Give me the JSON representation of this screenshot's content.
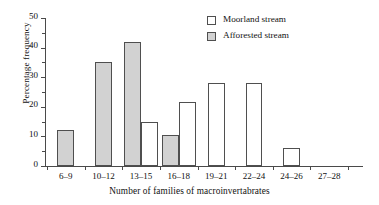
{
  "chart_data": {
    "type": "bar",
    "title": "",
    "xlabel": "Number of families of macroinvertabrates",
    "ylabel": "Percentage frequency",
    "categories": [
      "6–9",
      "10–12",
      "13–15",
      "16–18",
      "19–21",
      "22–24",
      "24–26",
      "27–28"
    ],
    "series": [
      {
        "name": "Moorland stream",
        "fill": "#ffffff",
        "values": [
          0,
          0,
          15,
          21.5,
          28,
          28,
          6,
          0
        ]
      },
      {
        "name": "Afforested stream",
        "fill": "#d2d2d2",
        "values": [
          12,
          35,
          42,
          10.5,
          0,
          0,
          0,
          0
        ]
      }
    ],
    "ylim": [
      0,
      50
    ],
    "yticks": [
      0,
      10,
      20,
      30,
      40,
      50
    ],
    "ytick_labels": [
      "0",
      "10",
      "20",
      "30",
      "40",
      "50"
    ],
    "yminor_step": 5,
    "grid": false,
    "legend_position": "top-right"
  },
  "legend": {
    "items": [
      {
        "label": "Moorland stream",
        "swatch": "moorland"
      },
      {
        "label": "Afforested stream",
        "swatch": "afforested"
      }
    ]
  },
  "axes": {
    "y_title": "Percentage frequency",
    "x_title": "Number of families of macroinvertabrates"
  }
}
